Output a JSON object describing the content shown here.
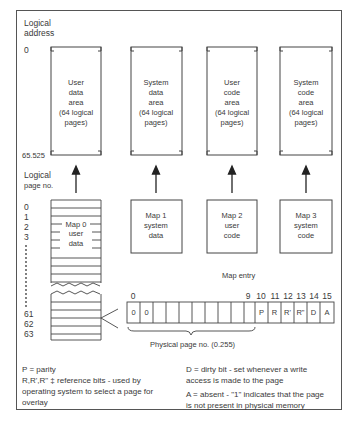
{
  "axis": {
    "logical_address_label": "Logical address",
    "logical_address_label_line1": "Logical",
    "logical_address_label_line2": "address",
    "addr_start": "0",
    "addr_end": "65.525",
    "logical_page_label_line1": "Logical",
    "logical_page_label_line2": "page no.",
    "page_numbers_top": [
      "0",
      "1",
      "2",
      "3"
    ],
    "page_numbers_bottom": [
      "61",
      "62",
      "63"
    ]
  },
  "areas": [
    {
      "lines": [
        "User",
        "data",
        "area",
        "(64 logical",
        "pages)"
      ]
    },
    {
      "lines": [
        "System",
        "data",
        "area",
        "(64 logical",
        "pages)"
      ]
    },
    {
      "lines": [
        "User",
        "code",
        "area",
        "(64 logical",
        "pages)"
      ]
    },
    {
      "lines": [
        "System",
        "code",
        "area",
        "(64 logical",
        "pages)"
      ]
    }
  ],
  "maps": [
    {
      "lines": [
        "Map 0",
        "user",
        "data"
      ]
    },
    {
      "lines": [
        "Map 1",
        "system",
        "data"
      ]
    },
    {
      "lines": [
        "Map 2",
        "user",
        "code"
      ]
    },
    {
      "lines": [
        "Map 3",
        "system",
        "code"
      ]
    }
  ],
  "map_entry": {
    "title": "Map entry",
    "bit_labels": [
      "0",
      "9",
      "10",
      "11",
      "12",
      "13",
      "14",
      "15"
    ],
    "cells": [
      "0",
      "0",
      "",
      "",
      "",
      "",
      "",
      "",
      "",
      "",
      "P",
      "R",
      "R'",
      "R\"",
      "D",
      "A"
    ],
    "physical_page_label": "Physical page no. (0.255)"
  },
  "legend": {
    "left": {
      "p": "P = parity",
      "r_line1": "R,R',R\" ‡ reference bits - used by",
      "r_line2": "operating system to select a page for",
      "r_line3": "overlay"
    },
    "right": {
      "d_line1": "D = dirty bit - set whenever a write",
      "d_line2": "access is made to the page",
      "a_line1": "A = absent - \"1\" indicates that the page",
      "a_line2": "is not present in physical memory"
    }
  }
}
